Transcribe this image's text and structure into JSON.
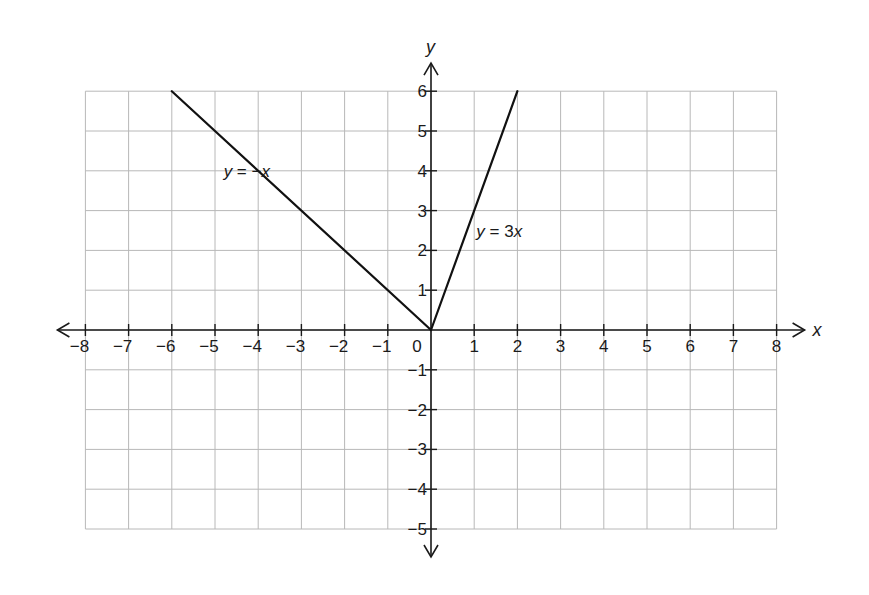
{
  "chart_data": {
    "type": "line",
    "title": "",
    "xlabel": "x",
    "ylabel": "y",
    "xlim": [
      -8,
      8
    ],
    "ylim": [
      -5,
      6
    ],
    "grid": true,
    "legend": "none (inline labels)",
    "x_ticks": [
      -8,
      -7,
      -6,
      -5,
      -4,
      -3,
      -2,
      -1,
      0,
      1,
      2,
      3,
      4,
      5,
      6,
      7,
      8
    ],
    "x_tick_labels": [
      "−8",
      "−7",
      "−6",
      "−5",
      "−4",
      "−3",
      "−2",
      "−1",
      "0",
      "1",
      "2",
      "3",
      "4",
      "5",
      "6",
      "7",
      "8"
    ],
    "y_ticks": [
      6,
      5,
      4,
      3,
      2,
      1,
      -1,
      -2,
      -3,
      -4,
      -5
    ],
    "y_tick_labels": [
      "6",
      "5",
      "4",
      "3",
      "2",
      "1",
      "−1",
      "−2",
      "−3",
      "−4",
      "−5"
    ],
    "series": [
      {
        "name": "y = −x",
        "label_var": "y",
        "label_rest": " = −",
        "label_var2": "x",
        "points": [
          [
            -6,
            6
          ],
          [
            0,
            0
          ]
        ],
        "label_position": [
          -4.8,
          4
        ]
      },
      {
        "name": "y = 3x",
        "label_var": "y",
        "label_rest": " = 3",
        "label_var2": "x",
        "points": [
          [
            0,
            0
          ],
          [
            2,
            6
          ]
        ],
        "label_position": [
          1.05,
          2.5
        ]
      }
    ],
    "annotations": [
      "y = −x",
      "y = 3x"
    ]
  },
  "layout": {
    "origin_px": [
      431,
      330
    ],
    "unit_px_x": 43.2,
    "unit_px_y": 39.8,
    "line_color": "#111111",
    "grid_color": "#b8b8b8"
  }
}
